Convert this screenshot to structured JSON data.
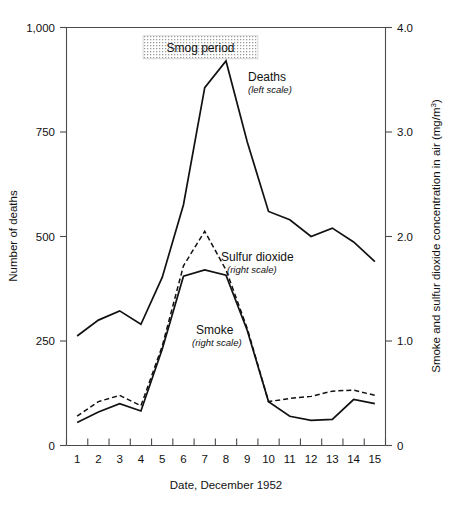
{
  "chart_data": {
    "type": "line",
    "title": "",
    "xlabel": "Date, December 1952",
    "x": [
      1,
      2,
      3,
      4,
      5,
      6,
      7,
      8,
      9,
      10,
      11,
      12,
      13,
      14,
      15
    ],
    "x_tick_labels": [
      "1",
      "2",
      "3",
      "4",
      "5",
      "6",
      "7",
      "8",
      "9",
      "10",
      "11",
      "12",
      "13",
      "14",
      "15"
    ],
    "xlim": [
      0.5,
      15.5
    ],
    "grid": false,
    "legend_position": "inline-annotations",
    "axes": {
      "left": {
        "label": "Number of deaths",
        "ticks": [
          0,
          250,
          500,
          750,
          1000
        ],
        "tick_labels": [
          "0",
          "250",
          "500",
          "750",
          "1,000"
        ],
        "lim": [
          0,
          1000
        ]
      },
      "right": {
        "label": "Smoke and sulfur dioxide concentration in air (mg/m",
        "label_exponent": "3",
        "label_suffix": ")",
        "ticks": [
          0,
          1.0,
          2.0,
          3.0,
          4.0
        ],
        "tick_labels": [
          "0",
          "1.0",
          "2.0",
          "3.0",
          "4.0"
        ],
        "lim": [
          0,
          4.0
        ]
      }
    },
    "series": [
      {
        "name": "Deaths",
        "sublabel": "(left scale)",
        "scale": "left",
        "style": "solid",
        "values": [
          262,
          300,
          322,
          290,
          402,
          576,
          856,
          920,
          726,
          560,
          540,
          500,
          520,
          487,
          440
        ]
      },
      {
        "name": "Sulfur dioxide",
        "sublabel": "(right scale)",
        "scale": "right",
        "style": "dashed",
        "values": [
          0.28,
          0.42,
          0.48,
          0.38,
          0.95,
          1.72,
          2.05,
          1.68,
          1.12,
          0.42,
          0.45,
          0.47,
          0.52,
          0.53,
          0.48
        ]
      },
      {
        "name": "Smoke",
        "sublabel": "(right scale)",
        "scale": "right",
        "style": "solid",
        "values": [
          0.22,
          0.32,
          0.4,
          0.33,
          0.92,
          1.62,
          1.68,
          1.63,
          1.1,
          0.42,
          0.28,
          0.24,
          0.25,
          0.44,
          0.4
        ]
      }
    ],
    "annotations": [
      {
        "name": "smog-period",
        "text": "Smog period",
        "type": "shaded-box",
        "x_start": 4.1,
        "x_end": 9.5,
        "y_left": 980,
        "height_left": 55
      }
    ]
  }
}
